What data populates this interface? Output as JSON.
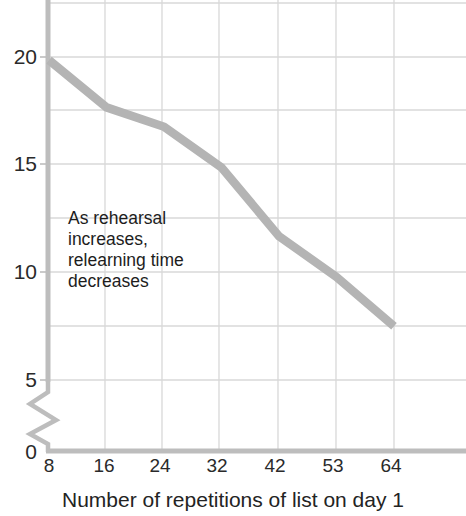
{
  "chart_data": {
    "type": "line",
    "title": "",
    "xlabel": "Number of repetitions of list on day 1",
    "ylabel": "",
    "x": [
      8,
      16,
      24,
      32,
      42,
      53,
      64
    ],
    "xtick_labels": [
      "8",
      "16",
      "24",
      "32",
      "42",
      "53",
      "64"
    ],
    "values": [
      19.9,
      17.7,
      16.8,
      14.9,
      11.7,
      9.8,
      7.5
    ],
    "ytick_labels": [
      "20",
      "15",
      "10",
      "5",
      "0"
    ],
    "ytick_values": [
      20,
      15,
      10,
      5,
      0
    ],
    "ylim": [
      0,
      21.5
    ],
    "y_axis_break": true,
    "y_axis_break_between": [
      0,
      5
    ],
    "grid": true,
    "legend_position": "none",
    "series": [
      {
        "name": "Relearning time",
        "values": [
          19.9,
          17.7,
          16.8,
          14.9,
          11.7,
          9.8,
          7.5
        ],
        "color": "#b4b4b4"
      }
    ],
    "annotations": [
      {
        "name": "trend-annotation",
        "lines": [
          "As rehearsal",
          "increases,",
          "relearning time",
          "decreases"
        ]
      }
    ],
    "colors": {
      "line": "#b4b4b4",
      "gridline": "#d8d8d8",
      "axis": "#bfbfbf",
      "text": "#242424",
      "background": "#ffffff"
    }
  },
  "annotation": {
    "line1": "As rehearsal",
    "line2": "increases,",
    "line3": "relearning time",
    "line4": "decreases"
  },
  "axis": {
    "x_title": "Number of repetitions of list on day 1",
    "ytick_0": "20",
    "ytick_1": "15",
    "ytick_2": "10",
    "ytick_3": "5",
    "ytick_4": "0",
    "xtick_0": "8",
    "xtick_1": "16",
    "xtick_2": "24",
    "xtick_3": "32",
    "xtick_4": "42",
    "xtick_5": "53",
    "xtick_6": "64"
  }
}
